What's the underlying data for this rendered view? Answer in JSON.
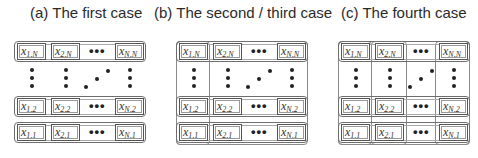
{
  "panels": [
    {
      "id": "a",
      "title": "(a) The first case",
      "variant": "rows"
    },
    {
      "id": "b",
      "title": "(b) The second / third case",
      "variant": "rows+first-column"
    },
    {
      "id": "c",
      "title": "(c) The fourth case",
      "variant": "rows+all-columns"
    }
  ],
  "cells": {
    "top_row": [
      "x",
      "x",
      "x"
    ],
    "top_row_subs": [
      "1,N",
      "2,N",
      "N,N"
    ],
    "row2_subs": [
      "1,2",
      "2,2",
      "N,2"
    ],
    "row1_subs": [
      "1,1",
      "2,1",
      "N,1"
    ],
    "ellipsis": "•••",
    "var": "x"
  },
  "colors": {
    "border": "#6e6e6e",
    "text": "#333333"
  }
}
